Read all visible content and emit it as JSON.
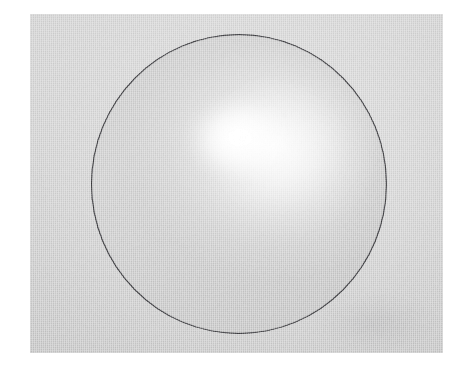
{
  "figure": {
    "kind": "photograph",
    "caption": "",
    "has_visible_text": false,
    "colors": {
      "paper_margin": "#ffffff",
      "cloth_background": "#c9c9c9",
      "sphere_body": "#cccccc",
      "sphere_outline": "#26262a",
      "specular_highlight": "#ffffff",
      "shadow_low": "#b4b4b4"
    },
    "geometry": {
      "canvas_width_px": 466,
      "canvas_height_px": 375,
      "plate_left_px": 30,
      "plate_top_px": 14,
      "plate_width_px": 413,
      "plate_height_px": 339,
      "circle_center_x_px": 238,
      "circle_center_y_px": 184,
      "circle_radius_x_px": 147,
      "circle_radius_y_px": 149,
      "highlight_center_x_px": 276,
      "highlight_center_y_px": 143
    }
  }
}
